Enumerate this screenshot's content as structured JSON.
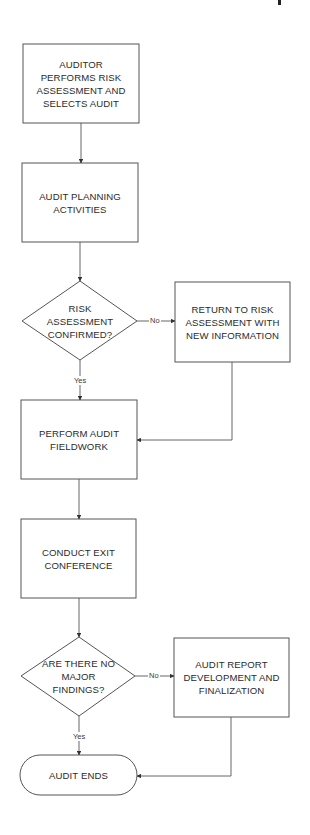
{
  "diagram": {
    "type": "flowchart",
    "colors": {
      "stroke": "#4a4a4a",
      "text": "#2b2b2b",
      "background": "#ffffff"
    },
    "nodes": [
      {
        "id": "n1",
        "shape": "process",
        "label": "AUDITOR\nPERFORMS RISK\nASSESSMENT AND\nSELECTS AUDIT"
      },
      {
        "id": "n2",
        "shape": "process",
        "label": "AUDIT PLANNING\nACTIVITIES"
      },
      {
        "id": "d1",
        "shape": "decision",
        "label": "RISK\nASSESSMENT\nCONFIRMED?"
      },
      {
        "id": "n3",
        "shape": "process",
        "label": "RETURN TO RISK\nASSESSMENT WITH\nNEW INFORMATION"
      },
      {
        "id": "n4",
        "shape": "process",
        "label": "PERFORM AUDIT\nFIELDWORK"
      },
      {
        "id": "n5",
        "shape": "process",
        "label": "CONDUCT EXIT\nCONFERENCE"
      },
      {
        "id": "d2",
        "shape": "decision",
        "label": "ARE THERE NO\nMAJOR\nFINDINGS?"
      },
      {
        "id": "n6",
        "shape": "process",
        "label": "AUDIT REPORT\nDEVELOPMENT AND\nFINALIZATION"
      },
      {
        "id": "t1",
        "shape": "terminal",
        "label": "AUDIT ENDS"
      }
    ],
    "edges": [
      {
        "from": "n1",
        "to": "n2",
        "label": ""
      },
      {
        "from": "n2",
        "to": "d1",
        "label": ""
      },
      {
        "from": "d1",
        "to": "n3",
        "label": "No"
      },
      {
        "from": "d1",
        "to": "n4",
        "label": "Yes"
      },
      {
        "from": "n3",
        "to": "n4",
        "label": ""
      },
      {
        "from": "n4",
        "to": "n5",
        "label": ""
      },
      {
        "from": "n5",
        "to": "d2",
        "label": ""
      },
      {
        "from": "d2",
        "to": "n6",
        "label": "No"
      },
      {
        "from": "d2",
        "to": "t1",
        "label": "Yes"
      },
      {
        "from": "n6",
        "to": "t1",
        "label": ""
      }
    ]
  }
}
